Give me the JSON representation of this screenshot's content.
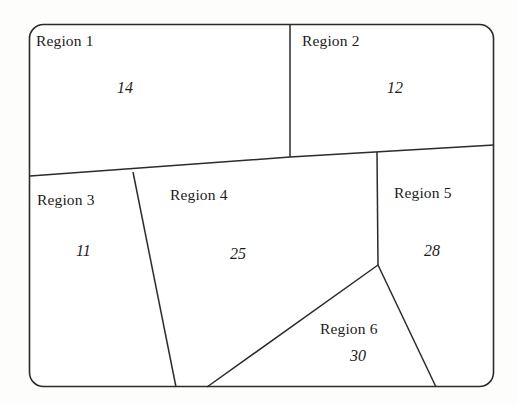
{
  "figure": {
    "kind": "partition-map-diagram",
    "stroke_color": "#2b2b2b",
    "background_color": "#fdfdfc",
    "border_shape": "rounded-rectangle"
  },
  "regions": [
    {
      "id": "region-1",
      "label": "Region 1",
      "value": "14",
      "label_x": 36,
      "label_y": 33,
      "value_x": 117,
      "value_y": 80
    },
    {
      "id": "region-2",
      "label": "Region 2",
      "value": "12",
      "label_x": 302,
      "label_y": 33,
      "value_x": 387,
      "value_y": 80
    },
    {
      "id": "region-3",
      "label": "Region 3",
      "value": "11",
      "label_x": 37,
      "label_y": 192,
      "value_x": 76,
      "value_y": 243
    },
    {
      "id": "region-4",
      "label": "Region 4",
      "value": "25",
      "label_x": 170,
      "label_y": 187,
      "value_x": 230,
      "value_y": 246
    },
    {
      "id": "region-5",
      "label": "Region 5",
      "value": "28",
      "label_x": 394,
      "label_y": 185,
      "value_x": 424,
      "value_y": 243
    },
    {
      "id": "region-6",
      "label": "Region 6",
      "value": "30",
      "label_x": 320,
      "label_y": 321,
      "value_x": 350,
      "value_y": 348
    }
  ],
  "geometry": {
    "outer_border": {
      "x": 29.5,
      "y": 24.5,
      "width": 464,
      "height": 362,
      "radius": 14
    },
    "dividers": [
      {
        "name": "region1-region2-divider",
        "points": "290,25 290,157"
      },
      {
        "name": "upper-lower-divider",
        "points": "30,176 290,157 494,145"
      },
      {
        "name": "region3-region4-divider",
        "points": "133,172 176,387"
      },
      {
        "name": "region4-region5-divider",
        "points": "377,152 378,265"
      },
      {
        "name": "region4-region6-divider",
        "points": "378,265 207,387"
      },
      {
        "name": "region5-region6-divider",
        "points": "378,265 436,387"
      }
    ]
  }
}
